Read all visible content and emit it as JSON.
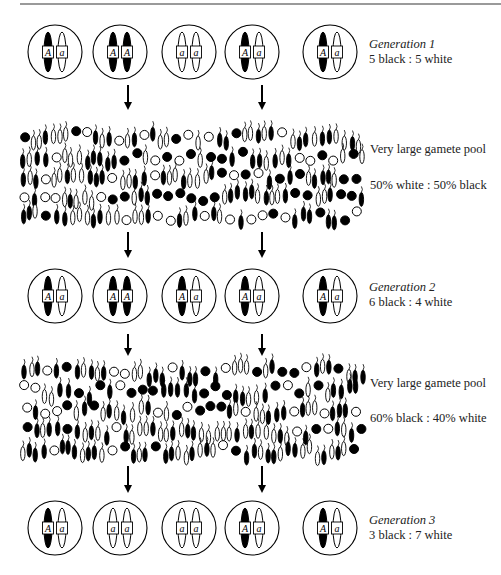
{
  "generations": [
    {
      "title": "Generation 1",
      "ratio": "5 black : 5 white",
      "genotypes": [
        "Aa",
        "AA",
        "aa",
        "Aa",
        "Aa"
      ],
      "cy": 52
    },
    {
      "title": "Generation 2",
      "ratio": "6 black : 4 white",
      "genotypes": [
        "Aa",
        "AA",
        "Aa",
        "Aa",
        "Aa"
      ],
      "cy": 296
    },
    {
      "title": "Generation 3",
      "ratio": "3 black : 7 white",
      "genotypes": [
        "Aa",
        "aa",
        "aa",
        "Aa",
        "Aa"
      ],
      "cy": 528
    }
  ],
  "gamete_pools": [
    {
      "label": "Very large gamete pool",
      "ratio": "50% white : 50% black",
      "black_fraction": 0.5,
      "y_top": 126,
      "y_bottom": 224
    },
    {
      "label": "Very large gamete pool",
      "ratio": "60% black : 40% white",
      "black_fraction": 0.6,
      "y_top": 360,
      "y_bottom": 458
    }
  ],
  "cell_x": [
    55,
    120,
    189,
    252,
    330
  ],
  "arrow_x": [
    128,
    262
  ],
  "arrows": [
    {
      "y1": 85,
      "y2": 110
    },
    {
      "y1": 232,
      "y2": 258
    },
    {
      "y1": 334,
      "y2": 356
    },
    {
      "y1": 466,
      "y2": 493
    }
  ],
  "allele_colors": {
    "A": "#000000",
    "a": "#ffffff"
  }
}
